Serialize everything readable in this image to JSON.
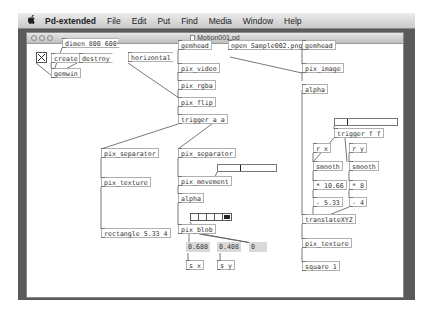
{
  "menubar": {
    "apple_icon": "",
    "app_name": "Pd-extended",
    "menus": [
      "File",
      "Edit",
      "Put",
      "Find",
      "Media",
      "Window",
      "Help"
    ]
  },
  "window": {
    "title": "Motion001.pd"
  },
  "patch": {
    "objects": {
      "dimen": "dimen 800 600",
      "create": "create",
      "destroy": "destroy",
      "gemwin": "gemwin",
      "horizontal": "horizontal",
      "gemhead1": "gemhead",
      "pix_video": "pix_video",
      "pix_rgba": "pix_rgba",
      "pix_flip": "pix_flip",
      "trigger_aa": "trigger a a",
      "pix_separator1": "pix_separator",
      "pix_texture1": "pix_texture",
      "rectangle": "rectangle 5.33 4",
      "pix_separator2": "pix_separator",
      "pix_movement": "pix_movement",
      "alpha1": "alpha",
      "pix_blob": "pix_blob",
      "open_msg": "open Sample002.png",
      "gemhead2": "gemhead",
      "pix_image": "pix_image",
      "alpha2": "alpha",
      "trigger_ff": "trigger f f",
      "r_x": "r x",
      "r_y": "r y",
      "smooth1": "smooth",
      "smooth2": "smooth",
      "mul_x": "* 10.66",
      "mul_y": "* 8",
      "sub_x": "- 5.33",
      "sub_y": "- 4",
      "translateXYZ": "translateXYZ",
      "pix_texture2": "pix_texture",
      "square": "square 1",
      "s_x": "s x",
      "s_y": "s y"
    },
    "number_boxes": {
      "blob_x": "0.680",
      "blob_y": "0.408",
      "blob_size": "0"
    },
    "toggle": {
      "checked": true
    },
    "sliders": {
      "movement_threshold": {
        "position_pct": 38
      },
      "trigger_slider": {
        "position_pct": 20
      }
    },
    "radio": {
      "cells": 5,
      "selected": 4
    }
  }
}
